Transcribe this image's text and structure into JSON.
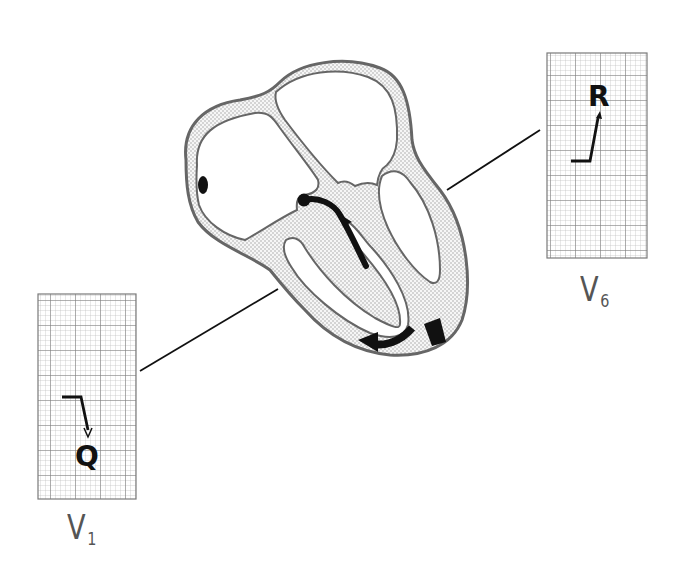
{
  "figure": {
    "colors": {
      "outline": "#666666",
      "wall_fill": "#ececec",
      "ink": "#111111",
      "grid_minor": "#bdbdbd",
      "grid_major": "#7a7a7a",
      "label": "#555555"
    }
  },
  "leads": [
    {
      "id": "v6",
      "label_main": "V",
      "label_sub": "6",
      "wave_letter": "R",
      "wave_description": "upright R wave deflection",
      "grid": {
        "major_cols": 4,
        "major_rows": 8,
        "minor_per_major": 5
      }
    },
    {
      "id": "v1",
      "label_main": "V",
      "label_sub": "1",
      "wave_letter": "Q",
      "wave_description": "downward Q wave deflection",
      "grid": {
        "major_cols": 4,
        "major_rows": 8,
        "minor_per_major": 5
      }
    }
  ],
  "heart": {
    "features": [
      "left-atrium",
      "right-atrium",
      "left-ventricle",
      "right-ventricle",
      "interventricular-septum",
      "sinoatrial-node",
      "av-node-conduction-arrow",
      "apical-depolarization-arrows"
    ]
  }
}
